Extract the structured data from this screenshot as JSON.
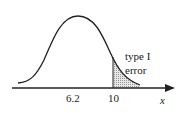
{
  "diagram": {
    "type": "normal-distribution-curve",
    "mean_label": "6.2",
    "critical_value_label": "10",
    "axis_label": "x",
    "region_label_line1": "type I",
    "region_label_line2": "error",
    "colors": {
      "curve": "#222222",
      "shade": "#bbbbbb",
      "axis": "#222222"
    }
  }
}
